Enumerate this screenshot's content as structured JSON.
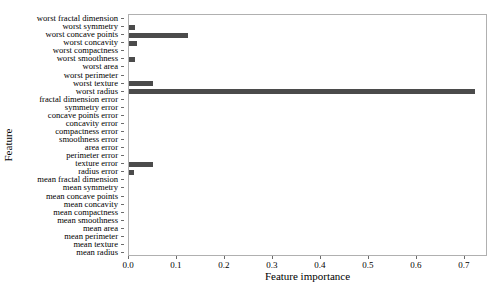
{
  "chart_data": {
    "type": "bar",
    "orientation": "horizontal",
    "title": "",
    "xlabel": "Feature importance",
    "ylabel": "Feature",
    "xlim": [
      0.0,
      0.748
    ],
    "grid": false,
    "legend": null,
    "bar_color": "#4b4b4b",
    "xticks": [
      0.0,
      0.1,
      0.2,
      0.3,
      0.4,
      0.5,
      0.6,
      0.7
    ],
    "xticklabels": [
      "0.0",
      "0.1",
      "0.2",
      "0.3",
      "0.4",
      "0.5",
      "0.6",
      "0.7"
    ],
    "categories": [
      "worst fractal dimension",
      "worst symmetry",
      "worst concave points",
      "worst concavity",
      "worst compactness",
      "worst smoothness",
      "worst area",
      "worst perimeter",
      "worst texture",
      "worst radius",
      "fractal dimension error",
      "symmetry error",
      "concave points error",
      "concavity error",
      "compactness error",
      "smoothness error",
      "area error",
      "perimeter error",
      "texture error",
      "radius error",
      "mean fractal dimension",
      "mean symmetry",
      "mean concave points",
      "mean concavity",
      "mean compactness",
      "mean smoothness",
      "mean area",
      "mean perimeter",
      "mean texture",
      "mean radius"
    ],
    "values": [
      0.0,
      0.012,
      0.123,
      0.016,
      0.0,
      0.012,
      0.0,
      0.0,
      0.05,
      0.721,
      0.0,
      0.0,
      0.0,
      0.0,
      0.0,
      0.0,
      0.0,
      0.0,
      0.05,
      0.011,
      0.0,
      0.0,
      0.0,
      0.0,
      0.0,
      0.0,
      0.0,
      0.0,
      0.0,
      0.0
    ]
  }
}
